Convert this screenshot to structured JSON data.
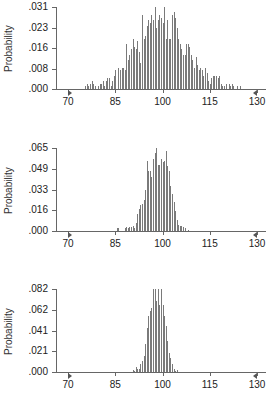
{
  "chart_data": [
    {
      "type": "bar",
      "title": "",
      "xlabel": "",
      "ylabel": "Probability",
      "xlim": [
        70,
        130
      ],
      "ylim": [
        0,
        0.031
      ],
      "xticks": [
        "70",
        "85",
        "100",
        "115",
        "130"
      ],
      "yticks": [
        ".031",
        ".023",
        ".016",
        ".008",
        ".000"
      ],
      "grid": false,
      "bin_start": 75.5,
      "bin_step": 0.5,
      "values": [
        0.001,
        0.002,
        0.001,
        0.002,
        0.003,
        0.002,
        0.001,
        0.0,
        0.001,
        0.002,
        0.002,
        0.003,
        0.001,
        0.003,
        0.004,
        0.004,
        0.001,
        0.003,
        0.005,
        0.007,
        0.0,
        0.008,
        0.007,
        0.008,
        0.008,
        0.007,
        0.017,
        0.011,
        0.013,
        0.015,
        0.019,
        0.016,
        0.015,
        0.018,
        0.014,
        0.01,
        0.028,
        0.019,
        0.02,
        0.024,
        0.026,
        0.025,
        0.028,
        0.026,
        0.031,
        0.023,
        0.026,
        0.028,
        0.027,
        0.025,
        0.031,
        0.019,
        0.026,
        0.019,
        0.019,
        0.028,
        0.029,
        0.027,
        0.023,
        0.019,
        0.017,
        0.015,
        0.013,
        0.013,
        0.017,
        0.017,
        0.016,
        0.013,
        0.011,
        0.008,
        0.012,
        0.009,
        0.007,
        0.008,
        0.007,
        0.005,
        0.008,
        0.006,
        0.003,
        0.002,
        0.004,
        0.005,
        0.005,
        0.005,
        0.004,
        0.005,
        0.002,
        0.001,
        0.001,
        0.002,
        0.0,
        0.002,
        0.001,
        0.002,
        0.001,
        0.0,
        0.001,
        0.0,
        0.001
      ]
    },
    {
      "type": "bar",
      "title": "",
      "xlabel": "",
      "ylabel": "Probability",
      "xlim": [
        70,
        130
      ],
      "ylim": [
        0,
        0.065
      ],
      "xticks": [
        "70",
        "85",
        "100",
        "115",
        "130"
      ],
      "yticks": [
        ".065",
        ".049",
        ".033",
        ".016",
        ".000"
      ],
      "grid": false,
      "bin_start": 85.5,
      "bin_step": 0.5,
      "values": [
        0.002,
        0.002,
        0.0,
        0.0,
        0.0,
        0.002,
        0.003,
        0.002,
        0.003,
        0.003,
        0.004,
        0.002,
        0.006,
        0.013,
        0.017,
        0.02,
        0.021,
        0.024,
        0.032,
        0.055,
        0.047,
        0.047,
        0.042,
        0.056,
        0.061,
        0.065,
        0.052,
        0.052,
        0.056,
        0.054,
        0.055,
        0.063,
        0.051,
        0.047,
        0.035,
        0.029,
        0.023,
        0.016,
        0.009,
        0.005,
        0.004,
        0.004,
        0.003,
        0.002,
        0.0,
        0.001
      ]
    },
    {
      "type": "bar",
      "title": "",
      "xlabel": "",
      "ylabel": "Probability",
      "xlim": [
        70,
        130
      ],
      "ylim": [
        0,
        0.082
      ],
      "xticks": [
        "70",
        "85",
        "100",
        "115",
        "130"
      ],
      "yticks": [
        ".082",
        ".062",
        ".041",
        ".021",
        ".000"
      ],
      "grid": false,
      "bin_start": 90.5,
      "bin_step": 0.5,
      "values": [
        0.002,
        0.001,
        0.005,
        0.003,
        0.003,
        0.008,
        0.011,
        0.016,
        0.028,
        0.043,
        0.055,
        0.06,
        0.063,
        0.082,
        0.082,
        0.07,
        0.082,
        0.066,
        0.082,
        0.066,
        0.055,
        0.045,
        0.031,
        0.019,
        0.014,
        0.008,
        0.003,
        0.001,
        0.002
      ]
    }
  ]
}
